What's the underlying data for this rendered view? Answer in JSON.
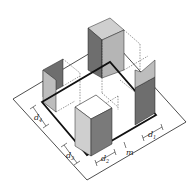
{
  "figure": {
    "labels": {
      "d4": {
        "main": "d",
        "sub": "4"
      },
      "d3": {
        "main": "d",
        "sub": "3"
      },
      "d2": {
        "main": "d",
        "sub": "2"
      },
      "m": {
        "main": "m"
      },
      "d1": {
        "main": "d",
        "sub": "1"
      }
    }
  },
  "colors": {
    "stroke": "#111111",
    "light_face": "#d2d2d2",
    "mid_face": "#a6a6a6",
    "dark_face": "#6e6e6e",
    "background": "#ffffff"
  }
}
